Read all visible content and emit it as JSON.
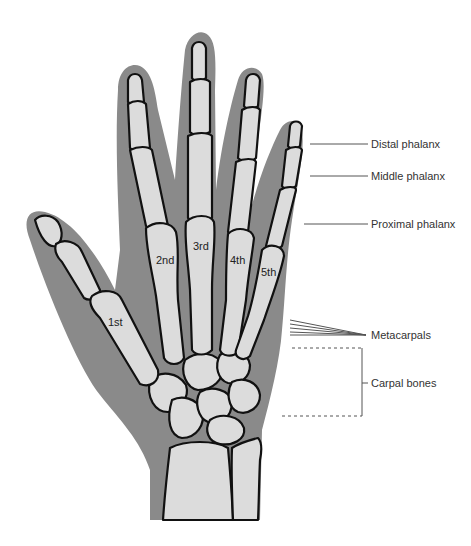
{
  "diagram": {
    "labels": {
      "distal_phalanx": "Distal phalanx",
      "middle_phalanx": "Middle phalanx",
      "proximal_phalanx": "Proximal phalanx",
      "metacarpals": "Metacarpals",
      "carpal_bones": "Carpal bones"
    },
    "metacarpal_numbers": [
      "1st",
      "2nd",
      "3rd",
      "4th",
      "5th"
    ],
    "colors": {
      "skin": "#8a8a8a",
      "bone": "#dcdcdc",
      "outline": "#111111",
      "label_text": "#333333",
      "leader_line": "#555555"
    }
  }
}
